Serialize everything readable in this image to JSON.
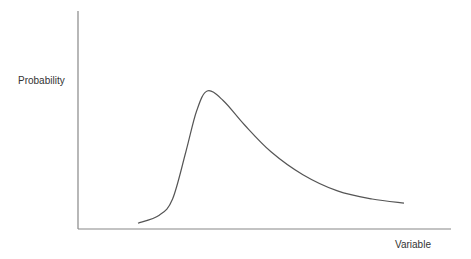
{
  "chart_data": {
    "type": "line",
    "title": "",
    "xlabel": "Variable",
    "ylabel": "Probability",
    "grid": false,
    "legend": null,
    "series": [
      {
        "name": "distribution",
        "x": [
          0.0,
          0.08,
          0.13,
          0.18,
          0.22,
          0.26,
          0.32,
          0.4,
          0.5,
          0.62,
          0.75,
          0.88,
          1.0
        ],
        "y": [
          0.02,
          0.08,
          0.2,
          0.55,
          0.85,
          1.0,
          0.93,
          0.75,
          0.55,
          0.38,
          0.26,
          0.2,
          0.17
        ]
      }
    ],
    "colors": {
      "axis": "#777777",
      "curve": "#555555"
    }
  },
  "labels": {
    "y_axis": "Probability",
    "x_axis": "Variable"
  }
}
